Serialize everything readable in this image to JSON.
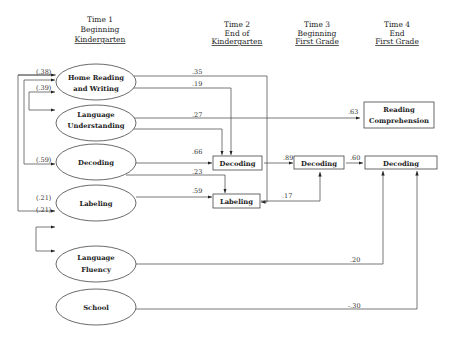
{
  "headers": [
    {
      "line1": "Time 1",
      "line2": "Beginning",
      "line3": "Kindergarten"
    },
    {
      "line1": "Time 2",
      "line2": "End of",
      "line3": "Kindergarten"
    },
    {
      "line1": "Time 3",
      "line2": "Beginning",
      "line3": "First Grade"
    },
    {
      "line1": "Time 4",
      "line2": "End",
      "line3": "First Grade"
    }
  ],
  "time1_nodes": [
    {
      "id": "home-reading",
      "line1": "Home Reading",
      "line2": "and Writing"
    },
    {
      "id": "language-understanding",
      "line1": "Language",
      "line2": "Understanding"
    },
    {
      "id": "decoding-t1",
      "line1": "Decoding",
      "line2": ""
    },
    {
      "id": "labeling-t1",
      "line1": "Labeling",
      "line2": ""
    },
    {
      "id": "language-fluency",
      "line1": "Language",
      "line2": "Fluency"
    },
    {
      "id": "school",
      "line1": "School",
      "line2": ""
    }
  ],
  "time2_nodes": {
    "decoding": "Decoding",
    "labeling": "Labeling"
  },
  "time3_nodes": {
    "decoding": "Decoding"
  },
  "time4_nodes": {
    "reading_line1": "Reading",
    "reading_line2": "Comprehension",
    "decoding": "Decoding"
  },
  "correlations": {
    "home_reading": "(.38)",
    "language_understanding": "(.39)",
    "decoding": "(.59)",
    "labeling_a": "(.21)",
    "labeling_b": "(.21)"
  },
  "paths": {
    "home_to_labeling_t2": ".35",
    "home_to_decoding_t2": ".19",
    "langund_to_reading": ".63",
    "langund_to_decoding_t2": ".27",
    "decoding_t1_to_decoding_t2": ".66",
    "decoding_t1_to_labeling_t2": ".23",
    "labeling_t1_to_labeling_t2": ".59",
    "decoding_t2_to_decoding_t3": ".89",
    "labeling_t2_to_decoding_t3": ".17",
    "decoding_t3_to_decoding_t4": ".60",
    "fluency_to_decoding_t4": ".20",
    "school_to_decoding_t4": "-.30"
  }
}
